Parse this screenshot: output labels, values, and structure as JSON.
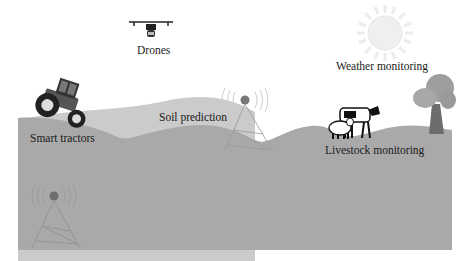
{
  "diagram": {
    "theme": "Smart farming / IoT in agriculture",
    "labels": {
      "drones": "Drones",
      "weather": "Weather monitoring",
      "soil": "Soil prediction",
      "tractors": "Smart tractors",
      "livestock": "Livestock monitoring"
    },
    "icons": [
      "drone-icon",
      "sun-icon",
      "tractor-icon",
      "signal-tower-icon",
      "signal-tower-icon",
      "cow-icon",
      "sheep-icon",
      "tree-icon"
    ],
    "colors": {
      "background": "#ffffff",
      "ground": "#a9a9a9",
      "hill_light": "#c9c9c9",
      "sun": "#efefef",
      "tower_dot": "#777777",
      "text": "#1a1a1a"
    }
  }
}
